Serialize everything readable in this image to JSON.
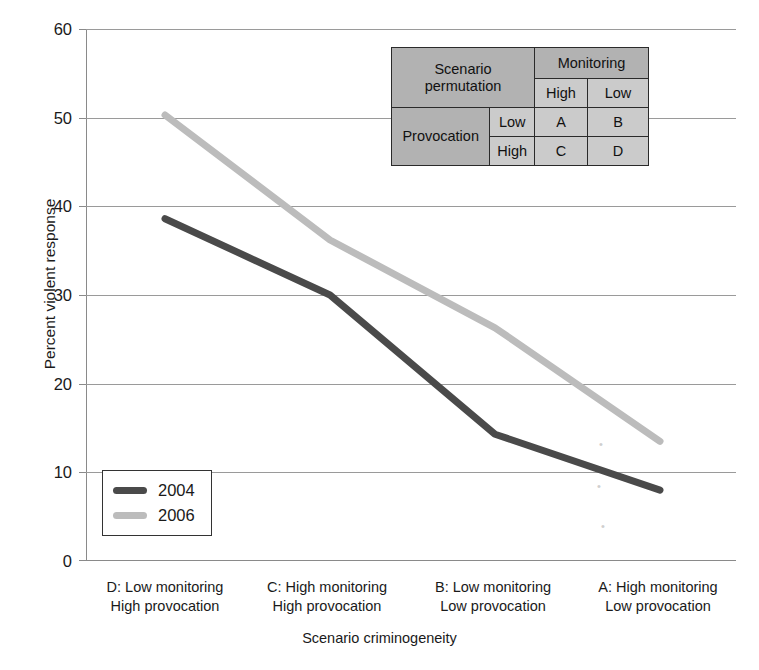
{
  "chart_data": {
    "type": "line",
    "title": "",
    "xlabel": "Scenario criminogeneity",
    "ylabel": "Percent violent response",
    "ylim": [
      0,
      60
    ],
    "ytick_labels": [
      "60",
      "50",
      "40",
      "30",
      "20",
      "10",
      "0"
    ],
    "ytick_values": [
      60,
      50,
      40,
      30,
      20,
      10,
      0
    ],
    "grid": true,
    "legend_position": "lower-left inside plot",
    "categories": [
      "D: Low monitoring High provocation",
      "C: High monitoring High provocation",
      "B: Low monitoring Low provocation",
      "A: High monitoring Low provocation"
    ],
    "series": [
      {
        "name": "2004",
        "values": [
          38.6,
          30.0,
          14.3,
          8.0
        ],
        "color": "#4a4a4a"
      },
      {
        "name": "2006",
        "values": [
          50.3,
          36.2,
          26.3,
          13.5
        ],
        "color": "#bcbcbc"
      }
    ]
  },
  "axes": {
    "y_title": "Percent violent response",
    "x_title": "Scenario criminogeneity",
    "y_ticks": [
      {
        "label": "60"
      },
      {
        "label": "50"
      },
      {
        "label": "40"
      },
      {
        "label": "30"
      },
      {
        "label": "20"
      },
      {
        "label": "10"
      },
      {
        "label": "0"
      }
    ],
    "x_ticks": [
      {
        "line1": "D: Low monitoring",
        "line2": "High provocation"
      },
      {
        "line1": "C: High monitoring",
        "line2": "High provocation"
      },
      {
        "line1": "B: Low monitoring",
        "line2": "Low provocation"
      },
      {
        "line1": "A: High monitoring",
        "line2": "Low provocation"
      }
    ]
  },
  "legend": {
    "items": [
      {
        "label": "2004",
        "color": "#4a4a4a"
      },
      {
        "label": "2006",
        "color": "#bcbcbc"
      }
    ]
  },
  "design_table": {
    "corner_title_line1": "Scenario",
    "corner_title_line2": "permutation",
    "column_group_header": "Monitoring",
    "column_headers": [
      "High",
      "Low"
    ],
    "row_group_header": "Provocation",
    "row_headers": [
      "Low",
      "High"
    ],
    "cells": [
      [
        "A",
        "B"
      ],
      [
        "C",
        "D"
      ]
    ]
  },
  "colors": {
    "series_2004": "#4a4a4a",
    "series_2006": "#bcbcbc",
    "gridline": "#9a9a9a",
    "table_header": "#b2b2b2",
    "table_cell": "#cbcbcb",
    "text": "#1a1a1a"
  }
}
